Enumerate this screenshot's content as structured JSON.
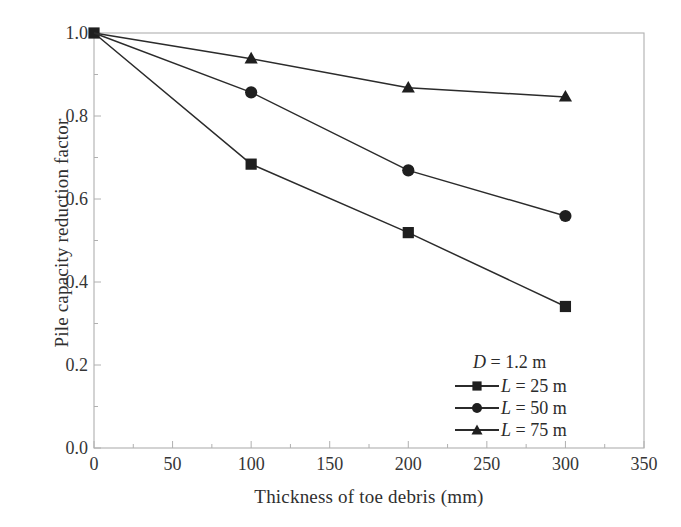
{
  "chart_data": {
    "type": "line",
    "title": "",
    "xlabel": "Thickness of toe debris (mm)",
    "ylabel": "Pile capacity reduction factor",
    "xlim": [
      0,
      350
    ],
    "ylim": [
      0.0,
      1.0
    ],
    "xticks": [
      0,
      50,
      100,
      150,
      200,
      250,
      300,
      350
    ],
    "xtick_labels": [
      "0",
      "50",
      "100",
      "150",
      "200",
      "250",
      "300",
      "350"
    ],
    "yticks": [
      0.0,
      0.2,
      0.4,
      0.6,
      0.8,
      1.0
    ],
    "ytick_labels": [
      "0.0",
      "0.2",
      "0.4",
      "0.6",
      "0.8",
      "1.0"
    ],
    "x_minor_tick_step": 25,
    "y_minor_tick_step": 0.1,
    "grid": false,
    "legend_position": "lower-right",
    "legend_note": "D = 1.2 m",
    "x": [
      0,
      100,
      200,
      300
    ],
    "series": [
      {
        "name": "L = 25 m",
        "marker": "square",
        "color": "#2b2b2b",
        "values": [
          1.0,
          0.684,
          0.519,
          0.341
        ]
      },
      {
        "name": "L = 50 m",
        "marker": "circle",
        "color": "#2b2b2b",
        "values": [
          1.0,
          0.857,
          0.669,
          0.559
        ]
      },
      {
        "name": "L = 75 m",
        "marker": "triangle",
        "color": "#2b2b2b",
        "values": [
          1.0,
          0.938,
          0.868,
          0.846
        ]
      }
    ]
  },
  "legend": {
    "note": "D = 1.2 m",
    "items": [
      {
        "label": "L = 25 m",
        "marker": "square"
      },
      {
        "label": "L = 50 m",
        "marker": "circle"
      },
      {
        "label": "L = 75 m",
        "marker": "triangle"
      }
    ]
  },
  "colors": {
    "line": "#2b2b2b",
    "marker": "#1f1f1f",
    "axis": "#b0b0b0",
    "text": "#2b2b2b",
    "background": "#ffffff"
  }
}
